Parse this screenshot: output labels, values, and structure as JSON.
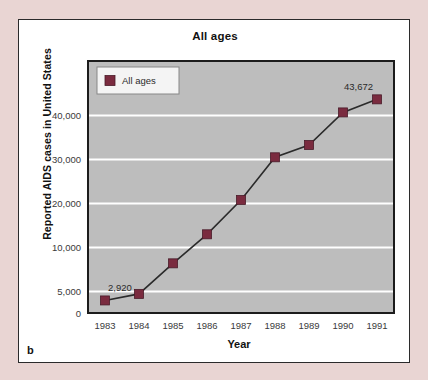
{
  "figure": {
    "panel_label": "b",
    "card_bg": "#ffffff",
    "page_bg": "#e9d5d3",
    "border_color": "#2b2b2b"
  },
  "chart_data": {
    "type": "line",
    "title": "All ages",
    "xlabel": "Year",
    "ylabel": "Reported AIDS cases in United States",
    "categories": [
      "1983",
      "1984",
      "1985",
      "1986",
      "1987",
      "1988",
      "1989",
      "1990",
      "1991"
    ],
    "values": [
      2920,
      4445,
      8200,
      13000,
      20800,
      30500,
      33300,
      40700,
      43672
    ],
    "series": [
      {
        "name": "All ages",
        "values": [
          2920,
          4445,
          8200,
          13000,
          20800,
          30500,
          33300,
          40700,
          43672
        ]
      }
    ],
    "ytick_labels": [
      "0",
      "5,000",
      "10,000",
      "20,000",
      "30,000",
      "40,000"
    ],
    "ytick_values": [
      0,
      5000,
      10000,
      20000,
      30000,
      40000
    ],
    "ylim": [
      0,
      45000
    ],
    "grid": "horizontal",
    "legend_position": "top-left",
    "legend_entries": [
      "All ages"
    ],
    "annotations": [
      {
        "text": "2,920",
        "category": "1983",
        "value": 2920
      },
      {
        "text": "43,672",
        "category": "1991",
        "value": 43672
      }
    ],
    "marker_color": "#7a2b3f",
    "line_color": "#2b2b2b",
    "plot_bg": "#bdbdbd",
    "gridline_color": "#ffffff"
  }
}
